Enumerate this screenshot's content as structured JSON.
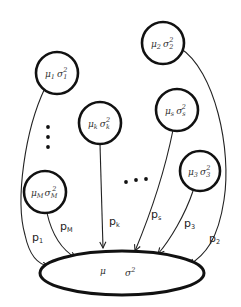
{
  "diagram": {
    "type": "mixture-pooling",
    "target": {
      "mu": "μ",
      "sigma": "σ",
      "sup": "2"
    },
    "components": [
      {
        "id": "1",
        "mu": "μ",
        "mu_sub": "1",
        "sigma": "σ",
        "sigma_sub": "1",
        "sup": "2",
        "edge_label": "p",
        "edge_sub": "1"
      },
      {
        "id": "2",
        "mu": "μ",
        "mu_sub": "2",
        "sigma": "σ",
        "sigma_sub": "2",
        "sup": "2",
        "edge_label": "p",
        "edge_sub": "2"
      },
      {
        "id": "k",
        "mu": "μ",
        "mu_sub": "k",
        "sigma": "σ",
        "sigma_sub": "k",
        "sup": "2",
        "edge_label": "p",
        "edge_sub": "k"
      },
      {
        "id": "s",
        "mu": "μ",
        "mu_sub": "s",
        "sigma": "σ",
        "sigma_sub": "s",
        "sup": "2",
        "edge_label": "p",
        "edge_sub": "s"
      },
      {
        "id": "3",
        "mu": "μ",
        "mu_sub": "3",
        "sigma": "σ",
        "sigma_sub": "3",
        "sup": "2",
        "edge_label": "p",
        "edge_sub": "3"
      },
      {
        "id": "M",
        "mu": "μ",
        "mu_sub": "M",
        "sigma": "σ",
        "sigma_sub": "M",
        "sup": "2",
        "edge_label": "p",
        "edge_sub": "M"
      }
    ],
    "ellipsis_vertical": "⋮",
    "ellipsis_horizontal": "…",
    "colors": {
      "stroke": "#111111",
      "background": "#ffffff",
      "text": "#333333"
    }
  }
}
